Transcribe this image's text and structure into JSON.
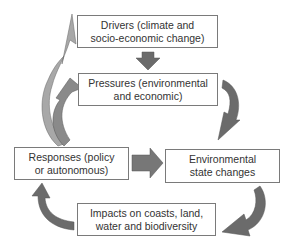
{
  "diagram": {
    "nodes": {
      "drivers": {
        "line1": "Drivers (climate and",
        "line2": "socio-economic change)"
      },
      "pressures": {
        "line1": "Pressures (environmental",
        "line2": "and economic)"
      },
      "responses": {
        "line1": "Responses (policy",
        "line2": "or autonomous)"
      },
      "state": {
        "line1": "Environmental",
        "line2": "state changes"
      },
      "impacts": {
        "line1": "Impacts on coasts, land,",
        "line2": "water and biodiversity"
      }
    },
    "edges": [
      {
        "from": "drivers",
        "to": "pressures"
      },
      {
        "from": "pressures",
        "to": "state"
      },
      {
        "from": "state",
        "to": "impacts"
      },
      {
        "from": "impacts",
        "to": "responses"
      },
      {
        "from": "responses",
        "to": "state"
      },
      {
        "from": "responses",
        "to": "drivers"
      },
      {
        "from": "responses",
        "to": "pressures"
      }
    ],
    "colors": {
      "arrow_dark": "#6b6b6b",
      "arrow_light": "#a8a8a8",
      "border": "#7a7a7a",
      "text": "#333333"
    }
  }
}
